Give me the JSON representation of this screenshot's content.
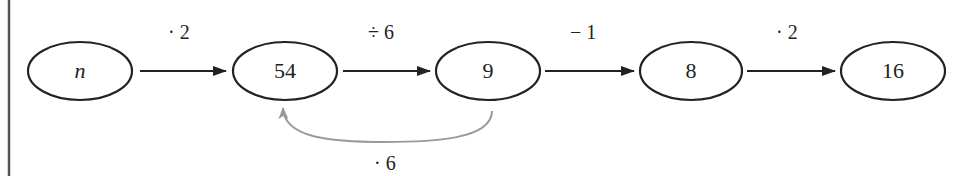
{
  "diagram": {
    "type": "flow",
    "nodes": [
      {
        "id": "n",
        "label": "n",
        "italic": true
      },
      {
        "id": "n54",
        "label": "54"
      },
      {
        "id": "n9",
        "label": "9"
      },
      {
        "id": "n8",
        "label": "8"
      },
      {
        "id": "n16",
        "label": "16"
      }
    ],
    "edges": [
      {
        "from": "n",
        "to": "n54",
        "label": "· 2"
      },
      {
        "from": "n54",
        "to": "n9",
        "label": "÷ 6"
      },
      {
        "from": "n9",
        "to": "n8",
        "label": "− 1"
      },
      {
        "from": "n8",
        "to": "n16",
        "label": "· 2"
      }
    ],
    "back_edge": {
      "from": "n9",
      "to": "n54",
      "label": "· 6",
      "color": "#9a9a9a"
    },
    "colors": {
      "stroke": "#222222",
      "back_edge": "#9a9a9a",
      "border": "#555555"
    }
  }
}
